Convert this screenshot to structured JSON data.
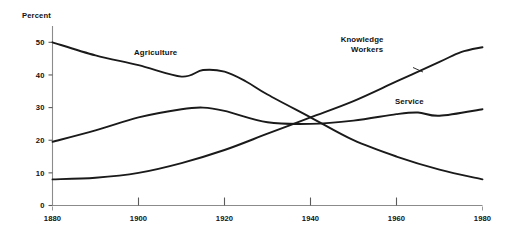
{
  "chart_data": {
    "type": "line",
    "title": "",
    "xlabel": "",
    "ylabel": "Percent",
    "xlim": [
      1880,
      1980
    ],
    "ylim": [
      0,
      55
    ],
    "grid": false,
    "legend_position": "inline-labels",
    "x_ticks": [
      1880,
      1900,
      1920,
      1940,
      1960,
      1980
    ],
    "x_tick_labels": [
      "1880",
      "1900",
      "1920",
      "1940",
      "1960",
      "1980"
    ],
    "y_ticks": [
      0,
      10,
      20,
      30,
      40,
      50
    ],
    "y_tick_labels": [
      "0",
      "10",
      "20",
      "30",
      "40",
      "50"
    ],
    "series": [
      {
        "name": "Agriculture",
        "label": "Agriculture",
        "x": [
          1880,
          1890,
          1900,
          1910,
          1915,
          1920,
          1925,
          1930,
          1940,
          1950,
          1960,
          1970,
          1980
        ],
        "values": [
          50,
          46,
          43,
          39.5,
          41.5,
          41,
          38,
          34,
          27,
          20,
          15,
          11,
          8
        ]
      },
      {
        "name": "Service",
        "label": "Service",
        "x": [
          1880,
          1890,
          1900,
          1910,
          1915,
          1920,
          1930,
          1940,
          1950,
          1960,
          1965,
          1970,
          1980
        ],
        "values": [
          19.5,
          23,
          27,
          29.5,
          30,
          29,
          25.5,
          25,
          26,
          28,
          28.5,
          27.5,
          29.5
        ]
      },
      {
        "name": "Knowledge Workers",
        "label": "Knowledge\nWorkers",
        "label_line_1": "Knowledge",
        "label_line_2": "Workers",
        "x": [
          1880,
          1890,
          1900,
          1910,
          1920,
          1930,
          1940,
          1950,
          1960,
          1970,
          1975,
          1980
        ],
        "values": [
          8,
          8.5,
          10,
          13,
          17,
          22,
          27,
          32,
          38,
          44,
          47,
          48.5
        ]
      }
    ],
    "annotations": [
      {
        "text": "Agriculture",
        "series": "Agriculture",
        "x": 1904,
        "y": 46
      },
      {
        "text": "Knowledge Workers",
        "series": "Knowledge Workers",
        "x": 1952,
        "y": 50
      },
      {
        "text": "Service",
        "series": "Service",
        "x": 1963,
        "y": 31
      }
    ]
  },
  "axis": {
    "y_title": "Percent"
  },
  "colors": {
    "line": "#1a1a1a",
    "axis": "#8b8b8b",
    "text": "#111111",
    "background": "#ffffff"
  }
}
